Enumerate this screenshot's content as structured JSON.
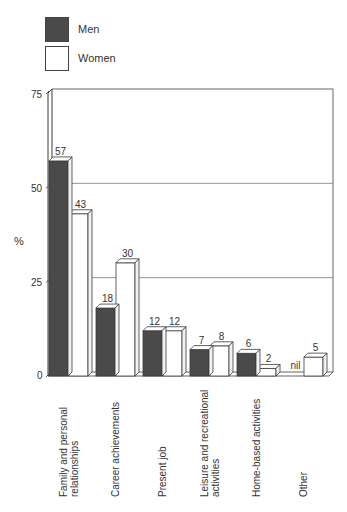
{
  "legend": {
    "men": {
      "label": "Men",
      "color": "#4a4a4a"
    },
    "women": {
      "label": "Women",
      "color": "#ffffff"
    }
  },
  "y_axis": {
    "label": "%",
    "ticks": [
      "0",
      "25",
      "50",
      "75"
    ]
  },
  "categories": [
    {
      "line1": "Family and personal",
      "line2": "relationships"
    },
    {
      "line1": "Career achievements",
      "line2": ""
    },
    {
      "line1": "Present job",
      "line2": ""
    },
    {
      "line1": "Leisure and recreational",
      "line2": "activities"
    },
    {
      "line1": "Home-based activities",
      "line2": ""
    },
    {
      "line1": "Other",
      "line2": ""
    }
  ],
  "value_labels": {
    "men": [
      "57",
      "18",
      "12",
      "7",
      "6",
      "nil"
    ],
    "women": [
      "43",
      "30",
      "12",
      "8",
      "2",
      "5"
    ]
  },
  "chart_data": {
    "type": "bar",
    "title": "",
    "xlabel": "",
    "ylabel": "%",
    "ylim": [
      0,
      75
    ],
    "yticks": [
      0,
      25,
      50,
      75
    ],
    "grid": true,
    "legend_position": "top-left",
    "categories": [
      "Family and personal relationships",
      "Career achievements",
      "Present job",
      "Leisure and recreational activities",
      "Home-based activities",
      "Other"
    ],
    "series": [
      {
        "name": "Men",
        "values": [
          57,
          18,
          12,
          7,
          6,
          0
        ],
        "labels": [
          "57",
          "18",
          "12",
          "7",
          "6",
          "nil"
        ]
      },
      {
        "name": "Women",
        "values": [
          43,
          30,
          12,
          8,
          2,
          5
        ],
        "labels": [
          "43",
          "30",
          "12",
          "8",
          "2",
          "5"
        ]
      }
    ]
  }
}
